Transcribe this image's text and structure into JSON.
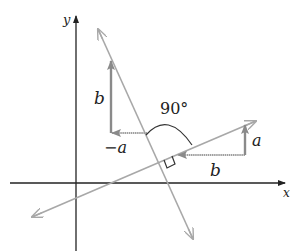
{
  "diagram": {
    "axes": {
      "x_label": "x",
      "y_label": "y"
    },
    "labels": {
      "b_vertical": "b",
      "neg_a": "−a",
      "angle": "90°",
      "a_vertical": "a",
      "b_horizontal": "b"
    },
    "colors": {
      "axis": "#222222",
      "line": "#a8a8a8",
      "vector": "#909090",
      "text": "#222222"
    }
  }
}
